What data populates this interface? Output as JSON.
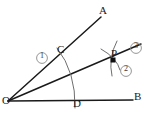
{
  "figure": {
    "canvas": {
      "width": 149,
      "height": 123,
      "background": "#ffffff"
    },
    "stroke_colors": {
      "ray": "#1a1a1a",
      "arc": "#6e6e6e",
      "point": "#101010",
      "badge_circle": "#8a8a8a",
      "label_text": "#1a1a1a",
      "badge_text": "#3c3c3c"
    },
    "points": {
      "vertex": {
        "label": "O",
        "x": 8,
        "y": 101
      },
      "ray_a_end": {
        "label": "A",
        "x": 103,
        "y": 14
      },
      "ray_b_end": {
        "label": "B",
        "x": 137,
        "y": 100
      },
      "arc_on_oa": {
        "label": "C",
        "x": 62,
        "y": 55
      },
      "arc_on_ob": {
        "label": "D",
        "x": 76,
        "y": 100
      },
      "intersection": {
        "label": "P",
        "x": 113,
        "y": 60
      }
    },
    "badges": [
      {
        "name": "badge-1",
        "label": "1",
        "x": 42,
        "y": 58,
        "meaning": "first arc centered at O crossing OA at C and OB at D"
      },
      {
        "name": "badge-2",
        "label": "2",
        "x": 126,
        "y": 71,
        "meaning": "second arc centered at D"
      },
      {
        "name": "badge-3",
        "label": "3",
        "x": 136,
        "y": 48,
        "meaning": "third arc centered at C"
      }
    ],
    "rays": [
      {
        "name": "ray-oa",
        "from": "O",
        "to": "A"
      },
      {
        "name": "ray-ob",
        "from": "O",
        "to": "B"
      },
      {
        "name": "ray-op",
        "from": "O",
        "through": "P",
        "role": "bisector"
      }
    ],
    "arcs": [
      {
        "name": "arc-1-cd",
        "center": "O",
        "passes_through": [
          "C",
          "D"
        ]
      },
      {
        "name": "arc-2-at-p",
        "center": "D",
        "passes_through": [
          "P"
        ]
      },
      {
        "name": "arc-3-at-p",
        "center": "C",
        "passes_through": [
          "P"
        ]
      }
    ]
  }
}
